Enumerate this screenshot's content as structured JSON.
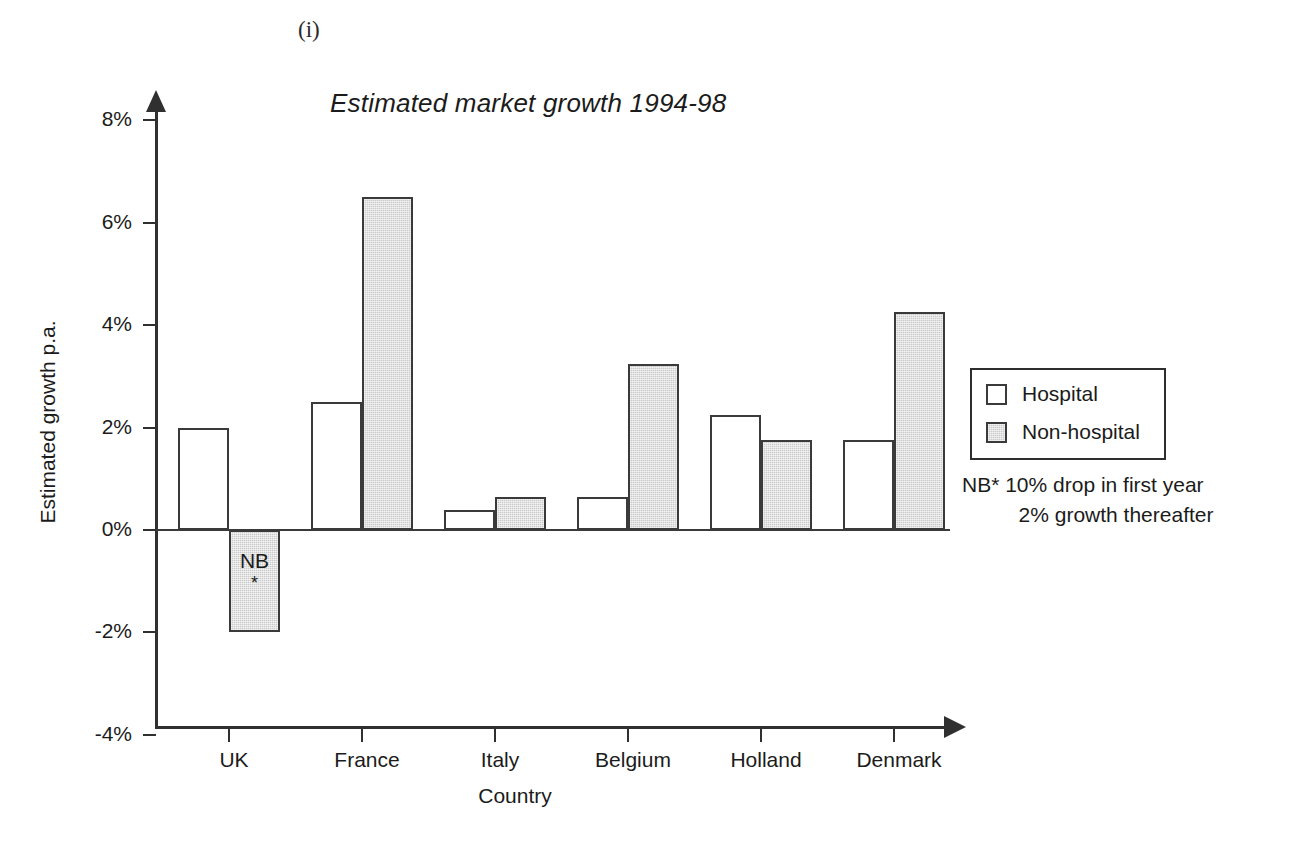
{
  "figure_label": "(i)",
  "chart_data": {
    "type": "bar",
    "title": "Estimated market growth 1994-98",
    "xlabel": "Country",
    "ylabel": "Estimated growth p.a.",
    "categories": [
      "UK",
      "France",
      "Italy",
      "Belgium",
      "Holland",
      "Denmark"
    ],
    "series": [
      {
        "name": "Hospital",
        "values": [
          2.0,
          2.5,
          0.4,
          0.65,
          2.25,
          1.75
        ]
      },
      {
        "name": "Non-hospital",
        "values": [
          -2.0,
          6.5,
          0.65,
          3.25,
          1.75,
          4.25
        ]
      }
    ],
    "ylim": [
      -4,
      8
    ],
    "ytick_labels": [
      "8%",
      "6%",
      "4%",
      "2%",
      "0%",
      "-2%",
      "-4%"
    ],
    "ytick_values": [
      8,
      6,
      4,
      2,
      0,
      -2,
      -4
    ],
    "grid": false,
    "legend_position": "right",
    "annotations": [
      {
        "target": "UK Non-hospital",
        "text": "NB",
        "marker": "*"
      }
    ]
  },
  "legend": {
    "entries": [
      {
        "label": "Hospital",
        "swatch": "white-square-icon"
      },
      {
        "label": "Non-hospital",
        "swatch": "gray-square-icon"
      }
    ],
    "note_line_1": "NB* 10% drop in first year",
    "note_line_2": "2% growth thereafter"
  },
  "colors": {
    "hospital_fill": "#ffffff",
    "nonhospital_fill": "#cacaca",
    "outline": "#3a3a3a",
    "text": "#1b1b1b"
  },
  "bar_annotation": {
    "label": "NB",
    "star": "*"
  }
}
